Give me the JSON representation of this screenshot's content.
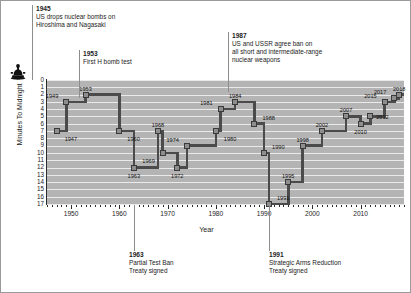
{
  "chart_data": {
    "type": "line",
    "title": "",
    "subtitle": "",
    "xlabel": "Year",
    "ylabel": "Minutes To Midnight",
    "xlim": [
      1945,
      2019
    ],
    "ylim": [
      0,
      17
    ],
    "y_inverted": true,
    "grid": true,
    "legend": null,
    "x_major_ticks": [
      1950,
      1960,
      1970,
      1980,
      1990,
      2000,
      2010
    ],
    "x_tick_labels": [
      "1950",
      "1960",
      "1970",
      "1980",
      "1990",
      "2000",
      "2010"
    ],
    "x_minor_tick_step": 1,
    "y_ticks": [
      0,
      1,
      2,
      3,
      4,
      5,
      6,
      7,
      8,
      9,
      10,
      11,
      12,
      13,
      14,
      15,
      16,
      17
    ],
    "y_tick_labels": [
      "0",
      "1",
      "2",
      "3",
      "4",
      "5",
      "6",
      "7",
      "8",
      "9",
      "10",
      "11",
      "12",
      "13",
      "14",
      "15",
      "16",
      "17"
    ],
    "marker_style": "square",
    "step_style": "post",
    "series": [
      {
        "name": "Doomsday Clock",
        "points": [
          {
            "year": 1947,
            "minutes": 7,
            "label": "1947",
            "lpos": "br"
          },
          {
            "year": 1949,
            "minutes": 3,
            "label": "1949",
            "lpos": "tl"
          },
          {
            "year": 1953,
            "minutes": 2,
            "label": "1953",
            "lpos": "t"
          },
          {
            "year": 1960,
            "minutes": 7,
            "label": "1960",
            "lpos": "br"
          },
          {
            "year": 1963,
            "minutes": 12,
            "label": "1963",
            "lpos": "b"
          },
          {
            "year": 1968,
            "minutes": 7,
            "label": "1968",
            "lpos": "t"
          },
          {
            "year": 1969,
            "minutes": 10,
            "label": "1969",
            "lpos": "bl"
          },
          {
            "year": 1972,
            "minutes": 12,
            "label": "1972",
            "lpos": "b"
          },
          {
            "year": 1974,
            "minutes": 9,
            "label": "1974",
            "lpos": "tl"
          },
          {
            "year": 1980,
            "minutes": 7,
            "label": "1980",
            "lpos": "br"
          },
          {
            "year": 1981,
            "minutes": 4,
            "label": "1981",
            "lpos": "tl"
          },
          {
            "year": 1984,
            "minutes": 3,
            "label": "1984",
            "lpos": "t"
          },
          {
            "year": 1988,
            "minutes": 6,
            "label": "1988",
            "lpos": "tr"
          },
          {
            "year": 1990,
            "minutes": 10,
            "label": "1990",
            "lpos": "tr"
          },
          {
            "year": 1991,
            "minutes": 17,
            "label": "1991",
            "lpos": "tr"
          },
          {
            "year": 1995,
            "minutes": 14,
            "label": "1995",
            "lpos": "t"
          },
          {
            "year": 1998,
            "minutes": 9,
            "label": "1998",
            "lpos": "t"
          },
          {
            "year": 2002,
            "minutes": 7,
            "label": "2002",
            "lpos": "t"
          },
          {
            "year": 2007,
            "minutes": 5,
            "label": "2007",
            "lpos": "t"
          },
          {
            "year": 2010,
            "minutes": 6,
            "label": "2010",
            "lpos": "b"
          },
          {
            "year": 2012,
            "minutes": 5,
            "label": "2012",
            "lpos": "r"
          },
          {
            "year": 2015,
            "minutes": 3,
            "label": "2015",
            "lpos": "tl"
          },
          {
            "year": 2017,
            "minutes": 2.5,
            "label": "2017",
            "lpos": "tl"
          },
          {
            "year": 2018,
            "minutes": 2,
            "label": "2018",
            "lpos": "t"
          }
        ]
      }
    ],
    "annotations": [
      {
        "id": "a1945",
        "year": "1945",
        "lines": [
          "US drops nuclear bombs on",
          "Hiroshima and Nagasaki"
        ],
        "position": "above",
        "anchor_year": 1945
      },
      {
        "id": "a1953",
        "year": "1953",
        "lines": [
          "First H bomb test"
        ],
        "position": "above",
        "anchor_year": 1953
      },
      {
        "id": "a1987",
        "year": "1987",
        "lines": [
          "US and USSR agree ban on",
          "all short and intermediate-range",
          "nuclear weapons"
        ],
        "position": "above",
        "anchor_year": 1987
      },
      {
        "id": "a1963",
        "year": "1963",
        "lines": [
          "Partial Test Ban",
          "Treaty signed"
        ],
        "position": "below",
        "anchor_year": 1963
      },
      {
        "id": "a1991",
        "year": "1991",
        "lines": [
          "Strategic Arms Reduction",
          "Treaty signed"
        ],
        "position": "below",
        "anchor_year": 1991
      }
    ],
    "colors": {
      "plot_background": "#b4b4b4",
      "gridline": "#eaeaea",
      "line": "#4b4b4b",
      "marker_fill": "#8e8e8e",
      "marker_edge": "#3a3a3a",
      "axis": "#2b2b2b",
      "text": "#1c1c1c",
      "frame": "#9a9a9a"
    },
    "icon": "doomsday-clock-icon"
  }
}
